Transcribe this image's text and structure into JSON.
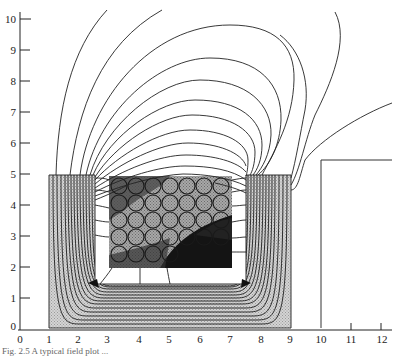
{
  "figure": {
    "type": "finite-element magnetic flux plot",
    "x_axis": {
      "ticks": [
        "0",
        "1",
        "2",
        "3",
        "4",
        "5",
        "6",
        "7",
        "8",
        "9",
        "10",
        "11",
        "12"
      ],
      "range": [
        0,
        12
      ]
    },
    "y_axis": {
      "ticks": [
        "0",
        "1",
        "2",
        "3",
        "4",
        "5",
        "6",
        "7",
        "8",
        "9",
        "10"
      ],
      "range": [
        0,
        10
      ]
    },
    "regions": {
      "core": {
        "x": [
          1,
          9
        ],
        "y": [
          0,
          5
        ],
        "fill": "#c8c8c8"
      },
      "window": {
        "x": [
          2.5,
          7.5
        ],
        "y": [
          1.45,
          5
        ]
      },
      "coil": {
        "x": [
          2.9,
          7.0
        ],
        "y": [
          1.9,
          4.9
        ]
      },
      "right_structure": {
        "x": [
          10,
          12.3
        ],
        "y": [
          0,
          5.5
        ]
      }
    },
    "colors": {
      "line": "#222222",
      "core_fill": "#c9c9c9",
      "coil_light": "#b4b4b4",
      "coil_dark": "#1a1a1a",
      "background": "#ffffff"
    },
    "caption": "Fig. 2.5  A typical field plot ..."
  }
}
